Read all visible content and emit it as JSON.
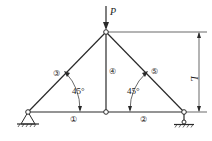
{
  "diagram": {
    "type": "truss",
    "load": {
      "label": "P"
    },
    "dimension": {
      "label": "L"
    },
    "angles": [
      {
        "label": "45°"
      },
      {
        "label": "45°"
      }
    ],
    "members": [
      {
        "id": 1,
        "label": "①"
      },
      {
        "id": 2,
        "label": "②"
      },
      {
        "id": 3,
        "label": "③"
      },
      {
        "id": 4,
        "label": "④"
      },
      {
        "id": 5,
        "label": "⑤"
      }
    ],
    "supports": [
      {
        "name": "left",
        "kind": "pin"
      },
      {
        "name": "right",
        "kind": "roller"
      }
    ],
    "colors": {
      "stroke": "#2a2a2a",
      "background": "#ffffff"
    }
  }
}
